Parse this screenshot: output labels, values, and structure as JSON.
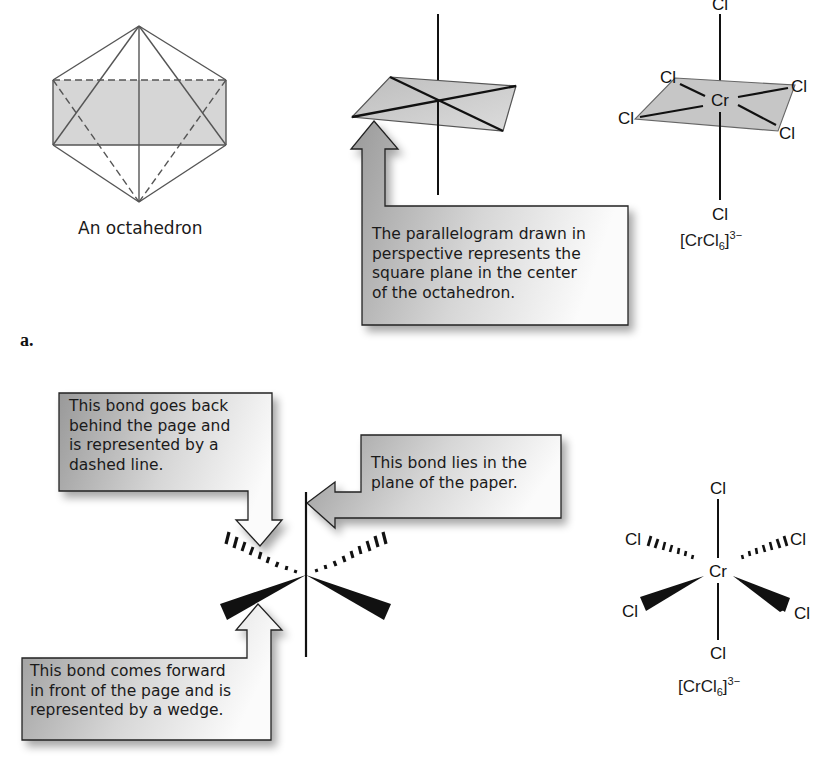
{
  "figure": {
    "part_label": "a.",
    "top_row": {
      "octahedron": {
        "caption": "An octahedron"
      },
      "square_plane_callout": {
        "text": "The parallelogram drawn in\nperspective represents the\nsquare plane in the center\nof the octahedron."
      },
      "complex": {
        "central_atom": "Cr",
        "ligands": [
          "Cl",
          "Cl",
          "Cl",
          "Cl",
          "Cl",
          "Cl"
        ],
        "formula": {
          "base": "[CrCl",
          "sub": "6",
          "bracket": "]",
          "charge": "3−"
        }
      }
    },
    "bottom_row": {
      "dashed_callout": {
        "text": "This bond goes back\nbehind the page and\nis represented by a\ndashed line."
      },
      "plane_callout": {
        "text": "This bond lies in the\nplane of the paper."
      },
      "wedge_callout": {
        "text": "This bond comes forward\nin front of the page and is\nrepresented by a wedge."
      },
      "complex": {
        "central_atom": "Cr",
        "ligands": [
          "Cl",
          "Cl",
          "Cl",
          "Cl",
          "Cl",
          "Cl"
        ],
        "formula": {
          "base": "[CrCl",
          "sub": "6",
          "bracket": "]",
          "charge": "3−"
        }
      }
    },
    "colors": {
      "plane_fill": "#c9c9c9",
      "callout_dark": "#9a9a9a",
      "callout_light": "#ffffff",
      "line": "#111111"
    }
  }
}
